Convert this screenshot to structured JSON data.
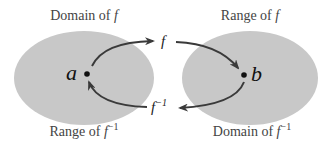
{
  "diagram": {
    "left_set": {
      "top_label": "Domain of",
      "top_label_var": "f",
      "bottom_label": "Range of",
      "bottom_label_var": "f",
      "bottom_label_sup": "−1",
      "point": "a",
      "fill": "#c8c8c8"
    },
    "right_set": {
      "top_label": "Range of",
      "top_label_var": "f",
      "bottom_label": "Domain of",
      "bottom_label_var": "f",
      "bottom_label_sup": "−1",
      "point": "b",
      "fill": "#c8c8c8"
    },
    "forward_arrow": {
      "label": "f"
    },
    "inverse_arrow": {
      "label": "f",
      "label_sup": "−1"
    },
    "arrow_color": "#3a3a3a"
  }
}
